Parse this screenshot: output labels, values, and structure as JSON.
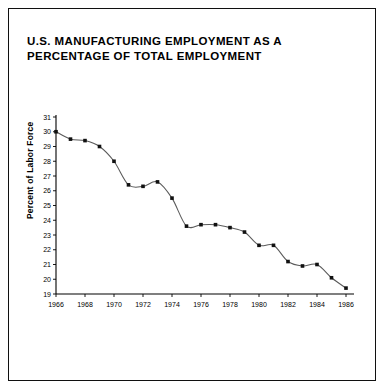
{
  "figure": {
    "title": "U.S. MANUFACTURING EMPLOYMENT AS A PERCENTAGE OF TOTAL EMPLOYMENT",
    "border_color": "#101010",
    "background_color": "#ffffff"
  },
  "chart_data": {
    "type": "line",
    "title": "U.S. MANUFACTURING EMPLOYMENT AS A PERCENTAGE OF TOTAL EMPLOYMENT",
    "xlabel": "",
    "ylabel": "Percent of Labor Force",
    "x": [
      1966,
      1967,
      1968,
      1969,
      1970,
      1971,
      1972,
      1973,
      1974,
      1975,
      1976,
      1977,
      1978,
      1979,
      1980,
      1981,
      1982,
      1983,
      1984,
      1985,
      1986
    ],
    "values": [
      30.0,
      29.5,
      29.4,
      29.0,
      28.0,
      26.4,
      26.3,
      26.6,
      25.5,
      23.6,
      23.7,
      23.7,
      23.5,
      23.2,
      22.3,
      22.3,
      21.2,
      20.9,
      21.0,
      20.1,
      19.4
    ],
    "series": [
      {
        "name": "Manufacturing employment share",
        "values": [
          30.0,
          29.5,
          29.4,
          29.0,
          28.0,
          26.4,
          26.3,
          26.6,
          25.5,
          23.6,
          23.7,
          23.7,
          23.5,
          23.2,
          22.3,
          22.3,
          21.2,
          20.9,
          21.0,
          20.1,
          19.4
        ]
      }
    ],
    "xlim": [
      1966,
      1986
    ],
    "ylim": [
      19,
      31
    ],
    "xticks": [
      1966,
      1968,
      1970,
      1972,
      1974,
      1976,
      1978,
      1980,
      1982,
      1984,
      1986
    ],
    "yticks": [
      19,
      20,
      21,
      22,
      23,
      24,
      25,
      26,
      27,
      28,
      29,
      30,
      31
    ],
    "xticklabels": [
      "1966",
      "1968",
      "1970",
      "1972",
      "1974",
      "1976",
      "1978",
      "1980",
      "1982",
      "1984",
      "1986"
    ],
    "yticklabels": [
      "19",
      "20",
      "21",
      "22",
      "23",
      "24",
      "25",
      "26",
      "27",
      "28",
      "29",
      "30",
      "31"
    ],
    "grid": false,
    "legend": false,
    "markers": true,
    "line_color": "#5a5a5a",
    "marker_color": "#111111"
  }
}
